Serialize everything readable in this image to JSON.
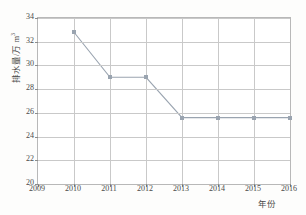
{
  "chart_data": {
    "type": "line",
    "title": "",
    "subtitle": "",
    "xlabel": "年份",
    "ylabel": "排水量/万 m³",
    "ylabel_main": "排水量/万 m",
    "ylabel_sup": "3",
    "x": [
      2010,
      2011,
      2012,
      2013,
      2014,
      2015,
      2016
    ],
    "values": [
      32.8,
      29.0,
      29.0,
      25.6,
      25.6,
      25.6,
      25.6
    ],
    "series": [
      {
        "name": "排水量",
        "values": [
          32.8,
          29.0,
          29.0,
          25.6,
          25.6,
          25.6,
          25.6
        ]
      }
    ],
    "xlim": [
      2009,
      2016
    ],
    "ylim": [
      20,
      34
    ],
    "xticks": [
      "2009",
      "2010",
      "2011",
      "2012",
      "2013",
      "2014",
      "2015",
      "2016"
    ],
    "xtick_values": [
      2009,
      2010,
      2011,
      2012,
      2013,
      2014,
      2015,
      2016
    ],
    "yticks": [
      "34",
      "32",
      "30",
      "28",
      "26",
      "24",
      "22",
      "20"
    ],
    "ytick_values": [
      34,
      32,
      30,
      28,
      26,
      24,
      22,
      20
    ],
    "grid": true,
    "legend": "none",
    "line_color": "#9aa4b0",
    "marker_color": "#9aa4b0",
    "marker_shape": "square",
    "grid_color": "#c9c9c9",
    "axis_color": "#b8b8b8",
    "text_color": "#4a4a4a",
    "plot_background": "#ffffff",
    "page_background": "#fdfdfc"
  }
}
